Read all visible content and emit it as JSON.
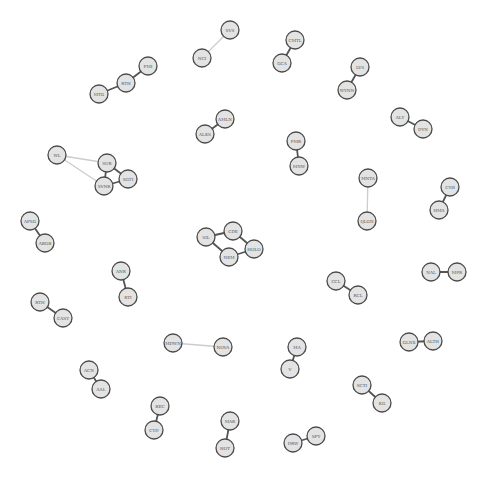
{
  "graph": {
    "type": "network",
    "node_radius": 9,
    "colors": {
      "node_fill": "#e3e3e3",
      "node_stroke": "#4a4a4a",
      "edge_strong": "#555555",
      "edge_weak": "#cccccc",
      "label": "#555555"
    },
    "nodes": [
      {
        "id": "SVS",
        "x": 230,
        "y": 30
      },
      {
        "id": "NCI",
        "x": 202,
        "y": 58
      },
      {
        "id": "PMI",
        "x": 148,
        "y": 66
      },
      {
        "id": "RTH",
        "x": 126,
        "y": 83
      },
      {
        "id": "MTG",
        "x": 99,
        "y": 94
      },
      {
        "id": "CMTL",
        "x": 295,
        "y": 40
      },
      {
        "id": "GCA",
        "x": 282,
        "y": 63
      },
      {
        "id": "LVS",
        "x": 360,
        "y": 67
      },
      {
        "id": "WYNN",
        "x": 347,
        "y": 90
      },
      {
        "id": "ALY",
        "x": 400,
        "y": 117
      },
      {
        "id": "DYN",
        "x": 423,
        "y": 129
      },
      {
        "id": "AMLN",
        "x": 225,
        "y": 119
      },
      {
        "id": "ALKS",
        "x": 205,
        "y": 134
      },
      {
        "id": "FMR",
        "x": 296,
        "y": 141
      },
      {
        "id": "MNW",
        "x": 299,
        "y": 166
      },
      {
        "id": "WL",
        "x": 57,
        "y": 155
      },
      {
        "id": "SUR",
        "x": 107,
        "y": 163
      },
      {
        "id": "SGTI",
        "x": 128,
        "y": 179
      },
      {
        "id": "SVNR",
        "x": 104,
        "y": 186
      },
      {
        "id": "MNTA",
        "x": 368,
        "y": 178
      },
      {
        "id": "QLGN",
        "x": 367,
        "y": 221
      },
      {
        "id": "CYH",
        "x": 450,
        "y": 187
      },
      {
        "id": "HMA",
        "x": 439,
        "y": 210
      },
      {
        "id": "AFSG",
        "x": 30,
        "y": 221
      },
      {
        "id": "ABGB",
        "x": 45,
        "y": 243
      },
      {
        "id": "CDE",
        "x": 233,
        "y": 231
      },
      {
        "id": "SIL",
        "x": 206,
        "y": 237
      },
      {
        "id": "HOLO",
        "x": 254,
        "y": 249
      },
      {
        "id": "NEM",
        "x": 229,
        "y": 257
      },
      {
        "id": "ANR",
        "x": 121,
        "y": 271
      },
      {
        "id": "RTI",
        "x": 128,
        "y": 297
      },
      {
        "id": "NAL",
        "x": 431,
        "y": 272
      },
      {
        "id": "MPR",
        "x": 457,
        "y": 272
      },
      {
        "id": "CCL",
        "x": 336,
        "y": 281
      },
      {
        "id": "RCL",
        "x": 358,
        "y": 295
      },
      {
        "id": "RTH2",
        "label": "RTH",
        "x": 40,
        "y": 302
      },
      {
        "id": "CASY",
        "x": 63,
        "y": 318
      },
      {
        "id": "MDWN",
        "x": 173,
        "y": 343
      },
      {
        "id": "NOVA",
        "x": 223,
        "y": 347
      },
      {
        "id": "MA",
        "x": 297,
        "y": 347
      },
      {
        "id": "V",
        "x": 290,
        "y": 369
      },
      {
        "id": "GLNX",
        "x": 409,
        "y": 342
      },
      {
        "id": "ALTH",
        "x": 433,
        "y": 341
      },
      {
        "id": "ACN",
        "x": 89,
        "y": 370
      },
      {
        "id": "AAL",
        "x": 101,
        "y": 389
      },
      {
        "id": "SCTI",
        "x": 362,
        "y": 385
      },
      {
        "id": "KG",
        "x": 382,
        "y": 403
      },
      {
        "id": "BEC",
        "x": 160,
        "y": 406
      },
      {
        "id": "CYD",
        "x": 154,
        "y": 430
      },
      {
        "id": "MAR",
        "x": 230,
        "y": 421
      },
      {
        "id": "HOT",
        "x": 225,
        "y": 448
      },
      {
        "id": "DRW",
        "x": 293,
        "y": 443
      },
      {
        "id": "SFY",
        "x": 316,
        "y": 436
      }
    ],
    "edges": [
      {
        "source": "SVS",
        "target": "NCI",
        "weight": "weak"
      },
      {
        "source": "PMI",
        "target": "RTH",
        "weight": "strong"
      },
      {
        "source": "RTH",
        "target": "MTG",
        "weight": "strong"
      },
      {
        "source": "CMTL",
        "target": "GCA",
        "weight": "strong"
      },
      {
        "source": "LVS",
        "target": "WYNN",
        "weight": "strong"
      },
      {
        "source": "ALY",
        "target": "DYN",
        "weight": "strong"
      },
      {
        "source": "AMLN",
        "target": "ALKS",
        "weight": "strong"
      },
      {
        "source": "FMR",
        "target": "MNW",
        "weight": "strong"
      },
      {
        "source": "WL",
        "target": "SUR",
        "weight": "weak"
      },
      {
        "source": "WL",
        "target": "SVNR",
        "weight": "weak"
      },
      {
        "source": "SUR",
        "target": "SGTI",
        "weight": "strong"
      },
      {
        "source": "SUR",
        "target": "SVNR",
        "weight": "strong"
      },
      {
        "source": "SGTI",
        "target": "SVNR",
        "weight": "strong"
      },
      {
        "source": "MNTA",
        "target": "QLGN",
        "weight": "weak"
      },
      {
        "source": "CYH",
        "target": "HMA",
        "weight": "strong"
      },
      {
        "source": "AFSG",
        "target": "ABGB",
        "weight": "strong"
      },
      {
        "source": "SIL",
        "target": "CDE",
        "weight": "strong"
      },
      {
        "source": "SIL",
        "target": "NEM",
        "weight": "strong"
      },
      {
        "source": "CDE",
        "target": "HOLO",
        "weight": "strong"
      },
      {
        "source": "NEM",
        "target": "HOLO",
        "weight": "strong"
      },
      {
        "source": "ANR",
        "target": "RTI",
        "weight": "strong"
      },
      {
        "source": "NAL",
        "target": "MPR",
        "weight": "strong"
      },
      {
        "source": "CCL",
        "target": "RCL",
        "weight": "strong"
      },
      {
        "source": "RTH2",
        "target": "CASY",
        "weight": "strong"
      },
      {
        "source": "MDWN",
        "target": "NOVA",
        "weight": "weak"
      },
      {
        "source": "MA",
        "target": "V",
        "weight": "strong"
      },
      {
        "source": "GLNX",
        "target": "ALTH",
        "weight": "strong"
      },
      {
        "source": "ACN",
        "target": "AAL",
        "weight": "strong"
      },
      {
        "source": "SCTI",
        "target": "KG",
        "weight": "strong"
      },
      {
        "source": "BEC",
        "target": "CYD",
        "weight": "strong"
      },
      {
        "source": "MAR",
        "target": "HOT",
        "weight": "strong"
      },
      {
        "source": "DRW",
        "target": "SFY",
        "weight": "strong"
      }
    ]
  }
}
